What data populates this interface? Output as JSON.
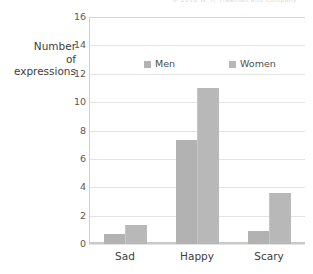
{
  "top_credit": "© 2010 W. H. Freeman and Company",
  "y_axis_title": {
    "line1": "Number",
    "line2": "of",
    "line3": "expressions"
  },
  "legend": {
    "men_label": "Men",
    "women_label": "Women",
    "men_color": "#b2b2b2",
    "women_color": "#b8b8b8"
  },
  "chart_data": {
    "type": "bar",
    "title": "",
    "xlabel": "",
    "ylabel": "Number of expressions",
    "categories": [
      "Sad",
      "Happy",
      "Scary"
    ],
    "series": [
      {
        "name": "Men",
        "values": [
          0.7,
          7.3,
          0.9
        ]
      },
      {
        "name": "Women",
        "values": [
          1.35,
          11.0,
          3.6
        ]
      }
    ],
    "ylim": [
      0,
      16
    ],
    "ytick_step": 2,
    "yticks": [
      0,
      2,
      4,
      6,
      8,
      10,
      12,
      14,
      16
    ],
    "ytick_labels": [
      "0",
      "2",
      "4",
      "6",
      "8",
      "10",
      "12",
      "14",
      "16"
    ],
    "grid": "horizontal",
    "legend_position": "inside-top"
  }
}
